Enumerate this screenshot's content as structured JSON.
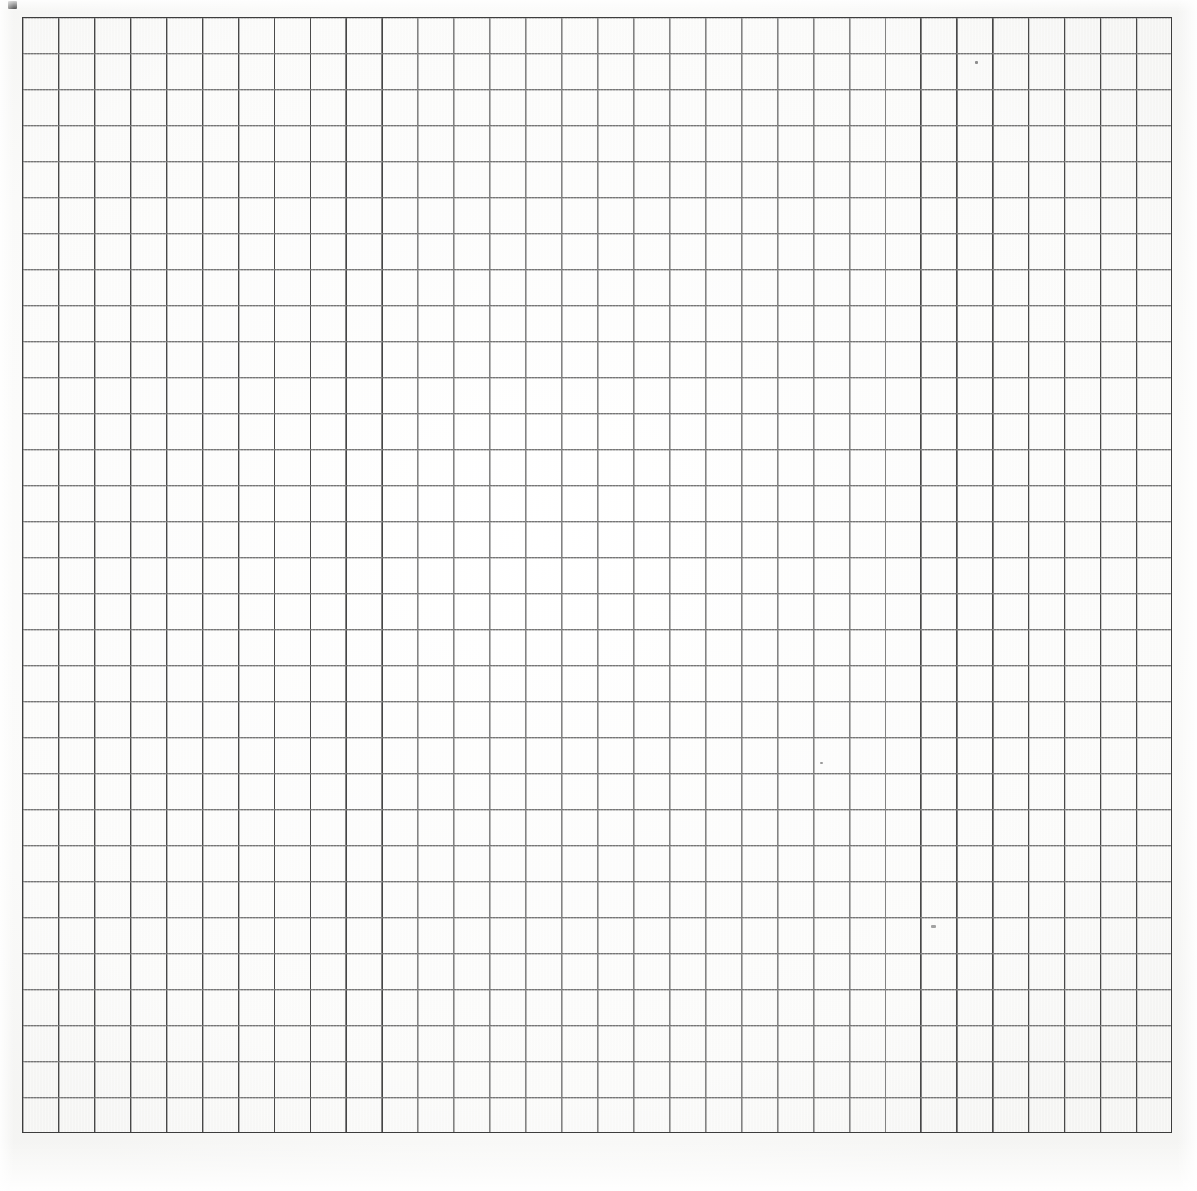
{
  "document": {
    "kind": "scanned-graph-paper",
    "title": "Blank graph paper sheet",
    "background_color": "#ffffff",
    "has_text": false,
    "notes": ""
  },
  "chart_data": {
    "type": "table",
    "title": "",
    "subtitle": "",
    "xlabel": "",
    "ylabel": "",
    "grid": true,
    "legend_position": "none",
    "categories": [],
    "values": [],
    "annotations": []
  },
  "grid": {
    "columns": 32,
    "rows": 31,
    "cell_width_px": 35.94,
    "cell_height_px": 36.0,
    "origin_x_px": 22,
    "origin_y_px": 17,
    "width_px": 1150,
    "height_px": 1116,
    "line_color": "#4a4a4a",
    "border_color": "#3d3d3d",
    "border_width_px": 1.6,
    "line_width_px": 1.15,
    "line_style": "printed-ruling"
  },
  "marks": {
    "fiducial": {
      "label": "registration-mark",
      "x_px": 8,
      "y_px": 1,
      "width_px": 9,
      "height_px": 8,
      "color": "#2b2b2b"
    },
    "specks": [
      {
        "x_px": 975,
        "y_px": 61,
        "w_px": 3,
        "h_px": 3,
        "color": "#8d8d8d"
      },
      {
        "x_px": 931,
        "y_px": 925,
        "w_px": 5,
        "h_px": 3,
        "color": "#a2a2a2"
      },
      {
        "x_px": 820,
        "y_px": 762,
        "w_px": 3,
        "h_px": 2,
        "color": "#9a9a9a"
      }
    ]
  },
  "canvas": {
    "width_px": 1197,
    "height_px": 1191
  }
}
